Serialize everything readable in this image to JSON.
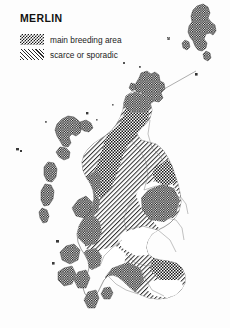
{
  "figure": {
    "title": "MERLIN",
    "background_color": "#fdfdfd",
    "width": 230,
    "height": 328
  },
  "legend": {
    "title": "MERLIN",
    "items": [
      {
        "swatch": "dense-checker-swatch",
        "label": "main breeding area",
        "pattern": "dense-checkerboard",
        "color": "#1a1a1a"
      },
      {
        "swatch": "diagonal-hatch-swatch",
        "label": "scarce or sporadic",
        "pattern": "diagonal-hatch",
        "color": "#2a2a2a"
      }
    ]
  },
  "map": {
    "region_name": "Scotland",
    "outline_color": "#4a4a4a",
    "admin_border_color": "#777777",
    "scale_bar": {
      "name": "scale-bar",
      "visible": true
    },
    "areas": [
      {
        "name": "shetland",
        "fill": "main breeding area"
      },
      {
        "name": "orkney",
        "fill": "main breeding area"
      },
      {
        "name": "outer-hebrides",
        "fill": "main breeding area"
      },
      {
        "name": "north-west-highlands",
        "fill": "main breeding area"
      },
      {
        "name": "caithness-sutherland",
        "fill": "scarce or sporadic"
      },
      {
        "name": "cairngorms-grampian",
        "fill": "main breeding area"
      },
      {
        "name": "central-highlands",
        "fill": "scarce or sporadic"
      },
      {
        "name": "inner-hebrides",
        "fill": "main breeding area"
      },
      {
        "name": "southern-uplands",
        "fill": "scarce or sporadic"
      },
      {
        "name": "galloway",
        "fill": "main breeding area"
      },
      {
        "name": "central-lowlands",
        "fill": "unshaded"
      }
    ]
  }
}
